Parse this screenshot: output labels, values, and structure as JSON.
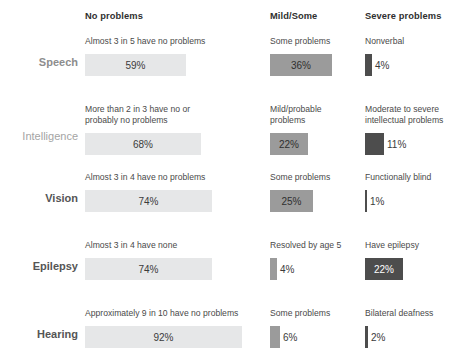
{
  "chart_data": {
    "type": "bar",
    "title": "",
    "subtitle": "",
    "xlabel": "",
    "ylabel": "",
    "grid": false,
    "legend_position": "top",
    "orientation": "horizontal",
    "scale_px_per_percent": 1.71,
    "units": "percent",
    "categories": [
      "Speech",
      "Intelligence",
      "Vision",
      "Epilepsy",
      "Hearing"
    ],
    "columns": [
      "No problems",
      "Mild/Some",
      "Severe problems"
    ],
    "series": [
      {
        "name": "No problems",
        "values": [
          59,
          68,
          74,
          74,
          92
        ],
        "labels": [
          "59%",
          "68%",
          "74%",
          "74%",
          "92%"
        ],
        "captions": [
          "Almost 3 in 5 have no problems",
          "More than 2 in 3 have no or\nprobably no problems",
          "Almost 3 in 4 have no problems",
          "Almost 3 in 4 have none",
          "Approximately 9 in 10 have no problems"
        ],
        "bar_color": "#e6e7e8",
        "text_color": "#3b3b3b"
      },
      {
        "name": "Mild/Some",
        "values": [
          36,
          22,
          25,
          4,
          6
        ],
        "labels": [
          "36%",
          "22%",
          "25%",
          "4%",
          "6%"
        ],
        "captions": [
          "Some problems",
          "Mild/probable\nproblems",
          "Some problems",
          "Resolved by age 5",
          "Some problems"
        ],
        "bar_color": "#9b9b9b",
        "text_color": "#2f2f2f"
      },
      {
        "name": "Severe problems",
        "values": [
          4,
          11,
          1,
          22,
          2
        ],
        "labels": [
          "4%",
          "11%",
          "1%",
          "22%",
          "2%"
        ],
        "captions": [
          "Nonverbal",
          "Moderate to severe\nintellectual problems",
          "Functionally blind",
          "Have epilepsy",
          "Bilateral deafness"
        ],
        "bar_color": "#4d4d4d",
        "text_color": "#ffffff"
      }
    ]
  },
  "header": {
    "col0": "No problems",
    "col1": "Mild/Some",
    "col2": "Severe problems"
  },
  "rows": [
    {
      "label": "Speech",
      "cells": [
        {
          "caption": "Almost 3 in 5 have no problems",
          "value": "59%"
        },
        {
          "caption": "Some problems",
          "value": "36%"
        },
        {
          "caption": "Nonverbal",
          "value": "4%"
        }
      ]
    },
    {
      "label": "Intelligence",
      "cells": [
        {
          "caption": "More than 2 in 3 have no or\nprobably no problems",
          "value": "68%"
        },
        {
          "caption": "Mild/probable\nproblems",
          "value": "22%"
        },
        {
          "caption": "Moderate to severe\nintellectual problems",
          "value": "11%"
        }
      ]
    },
    {
      "label": "Vision",
      "cells": [
        {
          "caption": "Almost 3 in 4 have no problems",
          "value": "74%"
        },
        {
          "caption": "Some problems",
          "value": "25%"
        },
        {
          "caption": "Functionally blind",
          "value": "1%"
        }
      ]
    },
    {
      "label": "Epilepsy",
      "cells": [
        {
          "caption": "Almost 3 in 4 have none",
          "value": "74%"
        },
        {
          "caption": "Resolved by age 5",
          "value": "4%"
        },
        {
          "caption": "Have epilepsy",
          "value": "22%"
        }
      ]
    },
    {
      "label": "Hearing",
      "cells": [
        {
          "caption": "Approximately 9 in 10 have no problems",
          "value": "92%"
        },
        {
          "caption": "Some problems",
          "value": "6%"
        },
        {
          "caption": "Bilateral deafness",
          "value": "2%"
        }
      ]
    }
  ],
  "colors": {
    "no_problems_bar": "#e6e7e8",
    "mild_bar": "#9b9b9b",
    "severe_bar": "#4d4d4d",
    "header_text": "#2f2f2f",
    "row_label_text": "#8d8d8d",
    "background": "#ffffff"
  }
}
